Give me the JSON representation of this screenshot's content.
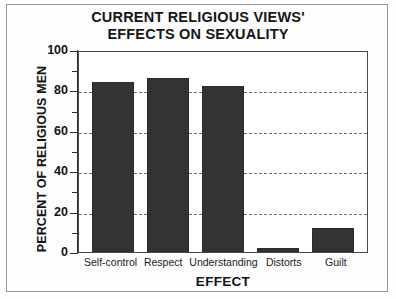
{
  "chart_data": {
    "type": "bar",
    "title": "CURRENT RELIGIOUS VIEWS'\nEFFECTS ON SEXUALITY",
    "xlabel": "EFFECT",
    "ylabel": "PERCENT OF RELIGIOUS MEN",
    "categories": [
      "Self-control",
      "Respect",
      "Understanding",
      "Distorts",
      "Guilt"
    ],
    "values": [
      84,
      86,
      82,
      2,
      12
    ],
    "ylim": [
      0,
      100
    ],
    "ytick_labels": [
      "0",
      "20",
      "40",
      "60",
      "80",
      "100"
    ],
    "ytick_values": [
      0,
      20,
      40,
      60,
      80,
      100
    ],
    "yminor_values": [
      10,
      30,
      50,
      70,
      90
    ],
    "gridlines_at": [
      20,
      40,
      60,
      80
    ],
    "grid": true,
    "legend": "none",
    "bar_color": "#333333",
    "axis_color": "#2d2d2d",
    "background_color": "#ffffff"
  }
}
